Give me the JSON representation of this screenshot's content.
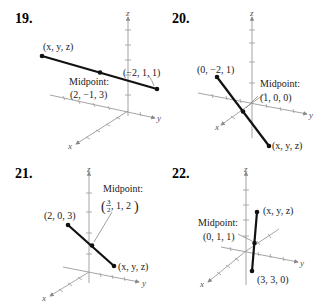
{
  "problems": [
    {
      "number": "19.",
      "endpoint_unknown": "(x, y, z)",
      "endpoint_known": "(−2, 1, 1)",
      "midpoint_title": "Midpoint:",
      "midpoint_value": "(2, −1, 3)",
      "axes": {
        "x": "x",
        "y": "y",
        "z": "z"
      }
    },
    {
      "number": "20.",
      "endpoint_known": "(0, −2, 1)",
      "endpoint_unknown": "(x, y, z)",
      "midpoint_title": "Midpoint:",
      "midpoint_value": "(1, 0, 0)",
      "axes": {
        "x": "x",
        "y": "y",
        "z": "z"
      }
    },
    {
      "number": "21.",
      "endpoint_known": "(2, 0, 3)",
      "endpoint_unknown": "(x, y, z)",
      "midpoint_title": "Midpoint:",
      "midpoint_value_frac_num": "3",
      "midpoint_value_frac_den": "2",
      "midpoint_value_rest": ", 1, 2",
      "axes": {
        "x": "x",
        "y": "y",
        "z": "z"
      }
    },
    {
      "number": "22.",
      "endpoint_unknown": "(x, y, z)",
      "endpoint_known": "(3, 3, 0)",
      "midpoint_title": "Midpoint:",
      "midpoint_value": "(0, 1, 1)",
      "axes": {
        "x": "x",
        "y": "y",
        "z": "z"
      }
    }
  ]
}
